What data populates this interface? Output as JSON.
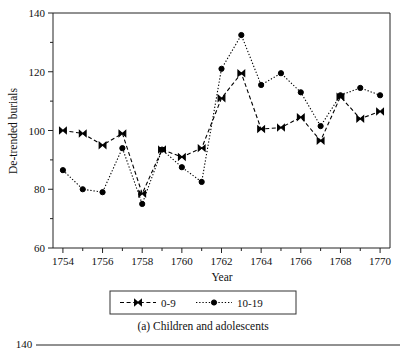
{
  "figure": {
    "caption": "(a) Children and adolescents",
    "next_figure_partial_ylabel": "140"
  },
  "chart_data": {
    "type": "line",
    "title": "",
    "xlabel": "Year",
    "ylabel": "De-trended burials",
    "xlim": [
      1753.5,
      1770.5
    ],
    "ylim": [
      60,
      140
    ],
    "ytick_values": [
      60,
      80,
      100,
      120,
      140
    ],
    "ytick_labels": [
      "60",
      "80",
      "100",
      "120",
      "140"
    ],
    "yminor_values": [
      70,
      90,
      110,
      130
    ],
    "xtick_values": [
      1754,
      1756,
      1758,
      1760,
      1762,
      1764,
      1766,
      1768,
      1770
    ],
    "xtick_labels": [
      "1754",
      "1756",
      "1758",
      "1760",
      "1762",
      "1764",
      "1766",
      "1768",
      "1770"
    ],
    "xminor_values": [
      1755,
      1757,
      1759,
      1761,
      1763,
      1765,
      1767,
      1769
    ],
    "grid": false,
    "legend_position": "below-axes",
    "x": [
      1754,
      1755,
      1756,
      1757,
      1758,
      1759,
      1760,
      1761,
      1762,
      1763,
      1764,
      1765,
      1766,
      1767,
      1768,
      1769,
      1770
    ],
    "series": [
      {
        "name": "0-9",
        "marker": "bowtie",
        "linestyle": "dashed",
        "color": "#000000",
        "values": [
          100.0,
          99.0,
          95.0,
          99.0,
          78.5,
          93.5,
          91.0,
          94.0,
          111.0,
          119.5,
          100.5,
          101.0,
          104.5,
          96.5,
          111.5,
          104.0,
          106.5
        ]
      },
      {
        "name": "10-19",
        "marker": "circle",
        "linestyle": "dotted",
        "color": "#000000",
        "values": [
          86.5,
          80.0,
          79.0,
          94.0,
          75.0,
          93.5,
          87.5,
          82.5,
          121.0,
          132.5,
          115.5,
          119.5,
          113.0,
          101.5,
          112.0,
          114.5,
          112.0
        ]
      }
    ]
  }
}
